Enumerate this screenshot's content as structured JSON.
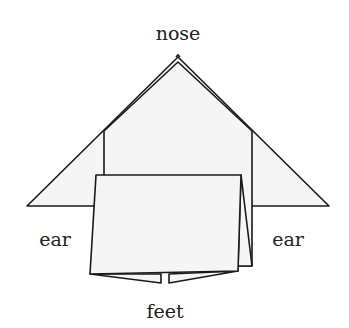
{
  "diagram": {
    "labels": {
      "nose": "nose",
      "ear_left": "ear",
      "ear_right": "ear",
      "feet": "feet"
    },
    "colors": {
      "paper": "#f5f5f5",
      "stroke": "#1a1a1a",
      "text": "#222222",
      "background": "#ffffff"
    }
  }
}
